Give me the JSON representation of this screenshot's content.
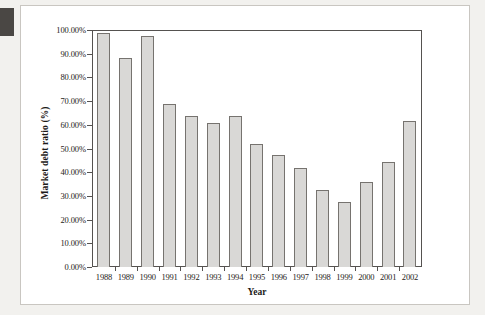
{
  "figure": {
    "background_color": "#ffffff",
    "panel_border_color": "#c9c6c1",
    "edge_marker_color": "#4a4744"
  },
  "chart_data": {
    "type": "bar",
    "title": "",
    "xlabel": "Year",
    "ylabel": "Market debt ratio (%)",
    "categories": [
      "1988",
      "1989",
      "1990",
      "1991",
      "1992",
      "1993",
      "1994",
      "1995",
      "1996",
      "1997",
      "1998",
      "1999",
      "2000",
      "2001",
      "2002"
    ],
    "values": [
      99.0,
      88.5,
      98.0,
      69.0,
      64.0,
      61.0,
      64.0,
      52.0,
      47.5,
      42.0,
      32.5,
      27.5,
      36.0,
      44.5,
      62.0
    ],
    "ylim": [
      0,
      100
    ],
    "ytick_values": [
      0,
      10,
      20,
      30,
      40,
      50,
      60,
      70,
      80,
      90,
      100
    ],
    "ytick_labels": [
      "0.00%",
      "10.00%",
      "20.00%",
      "30.00%",
      "40.00%",
      "50.00%",
      "60.00%",
      "70.00%",
      "80.00%",
      "90.00%",
      "100.00%"
    ],
    "grid": false,
    "legend": null,
    "bar_fill_color": "#d9d8d6",
    "bar_edge_color": "#76736f",
    "axis_color": "#555250"
  }
}
